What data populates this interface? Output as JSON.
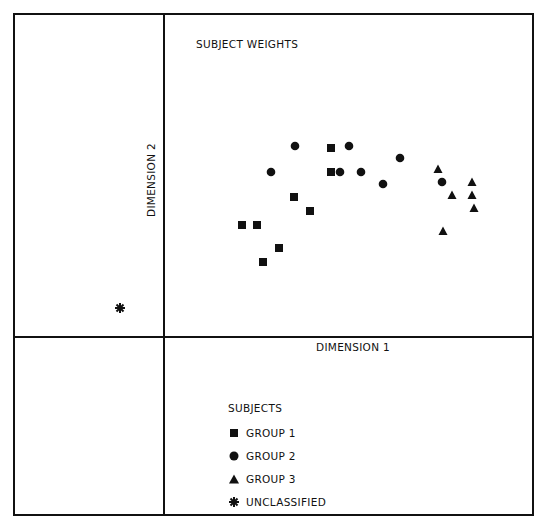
{
  "figure": {
    "title": "SUBJECT WEIGHTS",
    "xlabel": "DIMENSION 1",
    "ylabel": "DIMENSION 2"
  },
  "legend": {
    "title": "SUBJECTS",
    "items": [
      {
        "label": "GROUP 1",
        "marker": "square"
      },
      {
        "label": "GROUP 2",
        "marker": "circle"
      },
      {
        "label": "GROUP 3",
        "marker": "triangle"
      },
      {
        "label": "UNCLASSIFIED",
        "marker": "asterisk"
      }
    ]
  },
  "chart_data": {
    "type": "scatter",
    "title": "SUBJECT WEIGHTS",
    "xlabel": "DIMENSION 1",
    "ylabel": "DIMENSION 2",
    "note": "No tick marks or numeric scale shown; coordinates are approximate pixel positions in the 541x521 image",
    "grid": false,
    "legend_position": "bottom panel",
    "series": [
      {
        "name": "GROUP 1",
        "marker": "square",
        "points": [
          [
            242,
            225
          ],
          [
            257,
            225
          ],
          [
            263,
            262
          ],
          [
            279,
            248
          ],
          [
            294,
            197
          ],
          [
            310,
            211
          ],
          [
            331,
            148
          ],
          [
            331,
            172
          ]
        ]
      },
      {
        "name": "GROUP 2",
        "marker": "circle",
        "points": [
          [
            271,
            172
          ],
          [
            295,
            146
          ],
          [
            340,
            172
          ],
          [
            349,
            146
          ],
          [
            361,
            172
          ],
          [
            383,
            184
          ],
          [
            400,
            158
          ],
          [
            442,
            182
          ]
        ]
      },
      {
        "name": "GROUP 3",
        "marker": "triangle",
        "points": [
          [
            438,
            169
          ],
          [
            452,
            195
          ],
          [
            472,
            182
          ],
          [
            472,
            195
          ],
          [
            474,
            208
          ],
          [
            443,
            231
          ]
        ]
      },
      {
        "name": "UNCLASSIFIED",
        "marker": "asterisk",
        "points": [
          [
            120,
            308
          ]
        ]
      }
    ]
  }
}
